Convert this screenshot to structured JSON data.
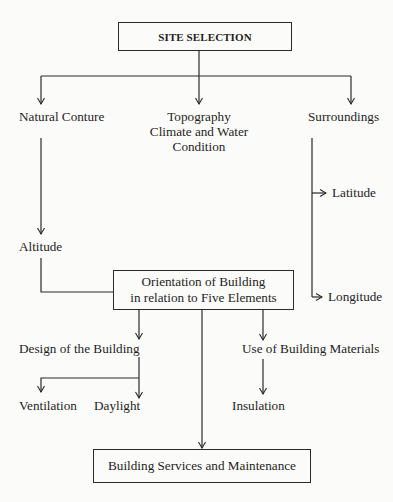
{
  "diagram": {
    "type": "flowchart",
    "root": {
      "label": "SITE SELECTION",
      "children": [
        {
          "label": "Natural Conture",
          "children": [
            {
              "label": "Altitude"
            }
          ]
        },
        {
          "label_lines": [
            "Topography",
            "Climate and Water",
            "Condition"
          ]
        },
        {
          "label": "Surroundings",
          "children": [
            {
              "label": "Latitude"
            },
            {
              "label": "Longitude"
            }
          ]
        }
      ]
    },
    "orientation": {
      "label_lines": [
        "Orientation of Building",
        "in relation to Five Elements"
      ],
      "children": [
        {
          "label": "Design of the Building",
          "children": [
            {
              "label": "Ventilation"
            },
            {
              "label": "Daylight"
            }
          ]
        },
        {
          "label": "Use of Building Materials",
          "children": [
            {
              "label": "Insulation"
            }
          ]
        }
      ]
    },
    "final": {
      "label": "Building Services and Maintenance"
    }
  },
  "nodes": {
    "site_selection": "SITE SELECTION",
    "natural_conture": "Natural Conture",
    "topography": "Topography",
    "climate_water": "Climate and Water",
    "condition": "Condition",
    "surroundings": "Surroundings",
    "latitude": "Latitude",
    "longitude": "Longitude",
    "altitude": "Altitude",
    "orientation_line1": "Orientation of Building",
    "orientation_line2": "in relation to Five Elements",
    "design": "Design of the Building",
    "materials": "Use of Building Materials",
    "ventilation": "Ventilation",
    "daylight": "Daylight",
    "insulation": "Insulation",
    "services": "Building Services and Maintenance"
  },
  "colors": {
    "background": "#fbfbf9",
    "line": "#2a2a2a",
    "text": "#1e1e1e"
  }
}
